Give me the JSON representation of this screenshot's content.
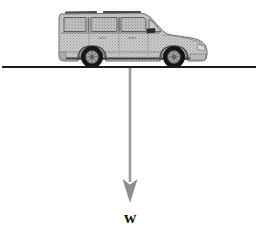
{
  "figure": {
    "background_color": "#ffffff",
    "width": 261,
    "height": 233
  },
  "ground": {
    "name": "horizontal ground line",
    "color": "#1c1c1c",
    "thickness": 2,
    "x_start": 2,
    "x_end": 256,
    "y": 67
  },
  "vehicle": {
    "name": "sport utility vehicle, side view, facing right",
    "body_color": "#c9c9c9",
    "body_outline_color": "#6b6b6b",
    "window_color": "#b5b5b5",
    "window_outline_color": "#5e5e5e",
    "tire_color": "#1a1a1a",
    "hub_color": "#a8a8a8",
    "hub_detail_color": "#5a5a5a",
    "mirror_color": "#2a2a2a",
    "roof_rail_color": "#4d4d4d",
    "rocker_color": "#3d3d3d",
    "bounds": {
      "left": 58,
      "top": 11,
      "right": 208,
      "bottom": 67
    },
    "wheels": [
      {
        "label": "rear wheel",
        "cx": 92,
        "cy": 57,
        "r": 11
      },
      {
        "label": "front wheel",
        "cx": 174,
        "cy": 57,
        "r": 11
      }
    ]
  },
  "weight_vector": {
    "name": "weight force arrow",
    "direction": "down",
    "color": "#8e8e8e",
    "shaft_color": "#9a9a9a",
    "shaft_x": 130,
    "y_start": 68,
    "y_tip": 203,
    "shaft_width": 2.6,
    "head_half_width": 7.5,
    "head_height": 24,
    "label": "w",
    "label_x": 130,
    "label_y": 209,
    "label_font_size": 17,
    "label_color": "#151515"
  }
}
